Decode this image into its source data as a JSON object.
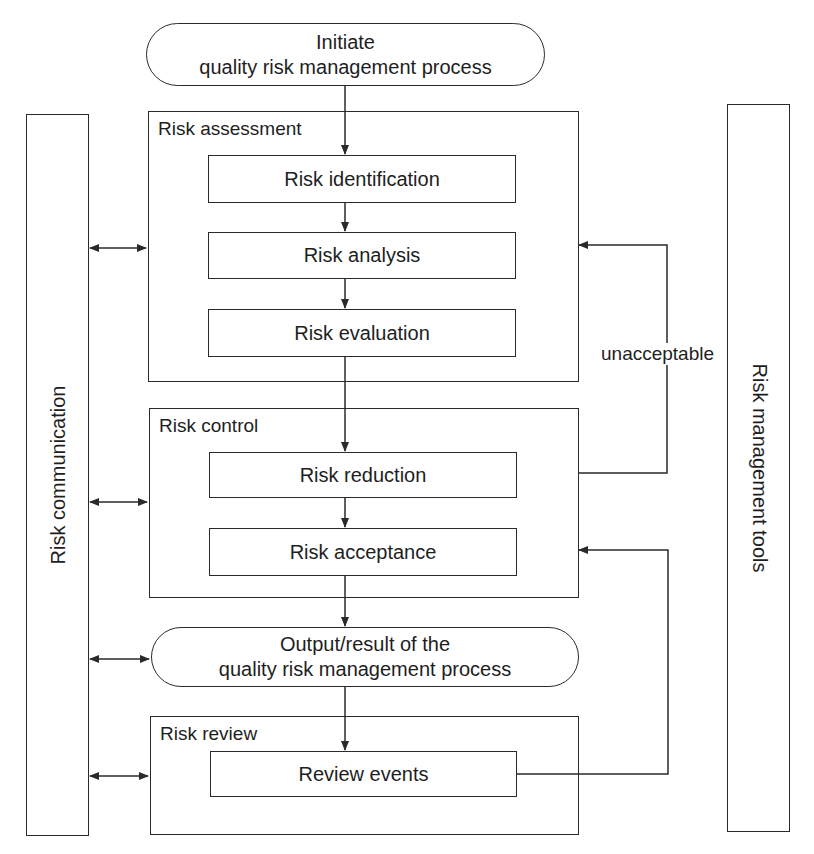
{
  "start": {
    "line1": "Initiate",
    "line2": "quality risk management process"
  },
  "side_bars": {
    "left": "Risk communication",
    "right": "Risk management tools"
  },
  "groups": [
    {
      "label": "Risk assessment",
      "steps": [
        "Risk identification",
        "Risk analysis",
        "Risk evaluation"
      ]
    },
    {
      "label": "Risk control",
      "steps": [
        "Risk reduction",
        "Risk acceptance"
      ]
    },
    {
      "label": "Risk review",
      "steps": [
        "Review events"
      ]
    }
  ],
  "output": {
    "line1": "Output/result of the",
    "line2": "quality risk management process"
  },
  "feedback": {
    "label": "unacceptable"
  },
  "colors": {
    "stroke": "#2a2a2a",
    "background": "#ffffff",
    "text": "#1e1e1e"
  }
}
